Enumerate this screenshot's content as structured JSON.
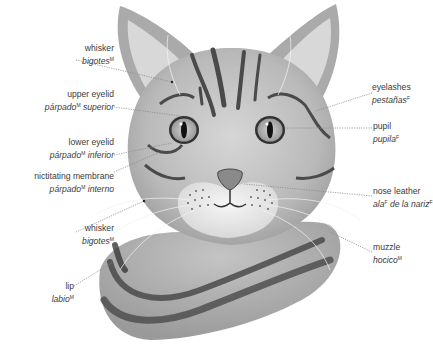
{
  "diagram": {
    "labels": [
      {
        "id": "whisker-top",
        "en": "whisker",
        "es": "bigotes",
        "es_sup": "M",
        "es_rest": "",
        "side": "left",
        "x": 30,
        "y": 43,
        "w": 84,
        "target": [
          172,
          82
        ]
      },
      {
        "id": "upper-eyelid",
        "en": "upper eyelid",
        "es": "párpado",
        "es_sup": "M",
        "es_rest": " superior",
        "side": "left",
        "x": 10,
        "y": 89,
        "w": 104,
        "target": [
          180,
          116
        ]
      },
      {
        "id": "lower-eyelid",
        "en": "lower eyelid",
        "es": "párpado",
        "es_sup": "M",
        "es_rest": " inferior",
        "side": "left",
        "x": 10,
        "y": 137,
        "w": 104,
        "target": [
          172,
          143
        ]
      },
      {
        "id": "nictitating-membrane",
        "en": "nictitating membrane",
        "es": "párpado",
        "es_sup": "M",
        "es_rest": " interno",
        "side": "left",
        "x": 0,
        "y": 171,
        "w": 114,
        "target": [
          160,
          152
        ]
      },
      {
        "id": "whisker-bottom",
        "en": "whisker",
        "es": "bigotes",
        "es_sup": "M",
        "es_rest": "",
        "side": "left",
        "x": 30,
        "y": 223,
        "w": 84,
        "target": [
          144,
          201
        ]
      },
      {
        "id": "lip",
        "en": "lip",
        "es": "labio",
        "es_sup": "M",
        "es_rest": "",
        "side": "left",
        "x": 30,
        "y": 281,
        "w": 44,
        "target": [
          113,
          262
        ]
      },
      {
        "id": "eyelashes",
        "en": "eyelashes",
        "es": "pestañas",
        "es_sup": "F",
        "es_rest": "",
        "side": "right",
        "x": 372,
        "y": 82,
        "w": 57,
        "target": [
          316,
          111
        ]
      },
      {
        "id": "pupil",
        "en": "pupil",
        "es": "pupila",
        "es_sup": "F",
        "es_rest": "",
        "side": "right",
        "x": 373,
        "y": 121,
        "w": 56,
        "target": [
          285,
          128
        ]
      },
      {
        "id": "nose-leather",
        "en": "nose leather",
        "es": "ala",
        "es_sup": "F",
        "es_rest": " de la nariz",
        "es_sup2": "F",
        "side": "right",
        "x": 373,
        "y": 186,
        "w": 56,
        "target": [
          244,
          184
        ]
      },
      {
        "id": "muzzle",
        "en": "muzzle",
        "es": "hocico",
        "es_sup": "M",
        "es_rest": "",
        "side": "right",
        "x": 373,
        "y": 242,
        "w": 56,
        "target": [
          258,
          216
        ]
      }
    ]
  },
  "colors": {
    "background": "#ffffff",
    "text": "#3a3a3a",
    "leader": "#8a8a8a",
    "fur_light": "#c9c9c9",
    "fur_mid": "#a8a8a8",
    "stripe": "#4a4a4a",
    "eye_iris": "#bdbdbd",
    "pupil": "#111111",
    "muzzle": "#eeeeee"
  }
}
